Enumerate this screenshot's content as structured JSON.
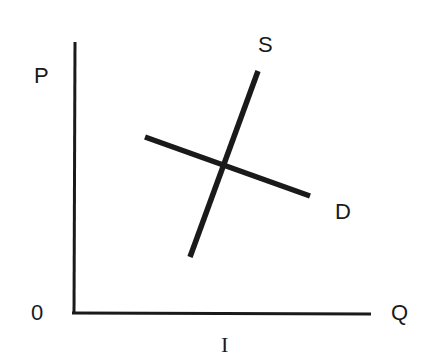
{
  "diagram": {
    "type": "supply-demand",
    "axes": {
      "y_label": "P",
      "x_label": "Q",
      "origin_label": "0",
      "caption": "I"
    },
    "curves": {
      "supply": {
        "label": "S",
        "from": [
          190,
          257
        ],
        "to": [
          258,
          71
        ]
      },
      "demand": {
        "label": "D",
        "from": [
          145,
          137
        ],
        "to": [
          310,
          196
        ]
      }
    },
    "colors": {
      "line": "#1a1a1a",
      "background": "#ffffff"
    }
  }
}
